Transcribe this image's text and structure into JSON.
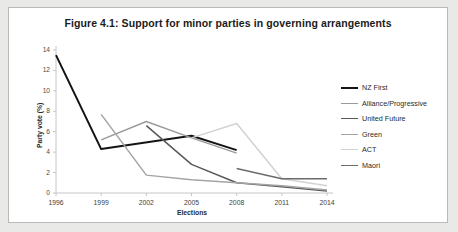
{
  "figure": {
    "title": "Figure 4.1: Support for minor parties in governing arrangements"
  },
  "chart_data": {
    "type": "line",
    "title": "Figure 4.1: Support for minor parties in governing arrangements",
    "xlabel": "Elections",
    "ylabel": "Party vote (%)",
    "categories": [
      "1996",
      "1999",
      "2002",
      "2005",
      "2008",
      "2011",
      "2014"
    ],
    "ylim": [
      0,
      14
    ],
    "yticks": [
      0,
      2,
      4,
      6,
      8,
      10,
      12,
      14
    ],
    "grid": false,
    "legend_position": "right",
    "series": [
      {
        "name": "NZ First",
        "color": "#141414",
        "width": 2.0,
        "points": [
          {
            "x": "1996",
            "y": 13.5
          },
          {
            "x": "1999",
            "y": 4.3
          },
          {
            "x": "2005",
            "y": 5.6
          },
          {
            "x": "2008",
            "y": 4.2
          }
        ]
      },
      {
        "name": "Alliance/Progressive",
        "color": "#9a9a9a",
        "width": 1.4,
        "points": [
          {
            "x": "1999",
            "y": 5.2
          },
          {
            "x": "2002",
            "y": 7.0
          },
          {
            "x": "2005",
            "y": 5.4
          },
          {
            "x": "2008",
            "y": 3.9
          }
        ]
      },
      {
        "name": "United Future",
        "color": "#585858",
        "width": 1.5,
        "points": [
          {
            "x": "2002",
            "y": 6.6
          },
          {
            "x": "2005",
            "y": 2.8
          },
          {
            "x": "2008",
            "y": 1.0
          },
          {
            "x": "2011",
            "y": 0.6
          },
          {
            "x": "2014",
            "y": 0.2
          }
        ]
      },
      {
        "name": "Green",
        "color": "#a4a4a4",
        "width": 1.5,
        "points": [
          {
            "x": "1999",
            "y": 7.7
          },
          {
            "x": "2002",
            "y": 1.75
          },
          {
            "x": "2005",
            "y": 1.3
          },
          {
            "x": "2008",
            "y": 1.0
          },
          {
            "x": "2011",
            "y": 0.7
          },
          {
            "x": "2014",
            "y": 0.3
          }
        ]
      },
      {
        "name": "ACT",
        "color": "#d2d2d2",
        "width": 1.5,
        "points": [
          {
            "x": "2005",
            "y": 5.4
          },
          {
            "x": "2008",
            "y": 6.8
          },
          {
            "x": "2011",
            "y": 1.4
          },
          {
            "x": "2014",
            "y": 0.7
          }
        ]
      },
      {
        "name": "Maori",
        "color": "#6b6b6b",
        "width": 1.6,
        "points": [
          {
            "x": "2008",
            "y": 2.4
          },
          {
            "x": "2011",
            "y": 1.4
          },
          {
            "x": "2014",
            "y": 1.4
          }
        ]
      }
    ]
  }
}
